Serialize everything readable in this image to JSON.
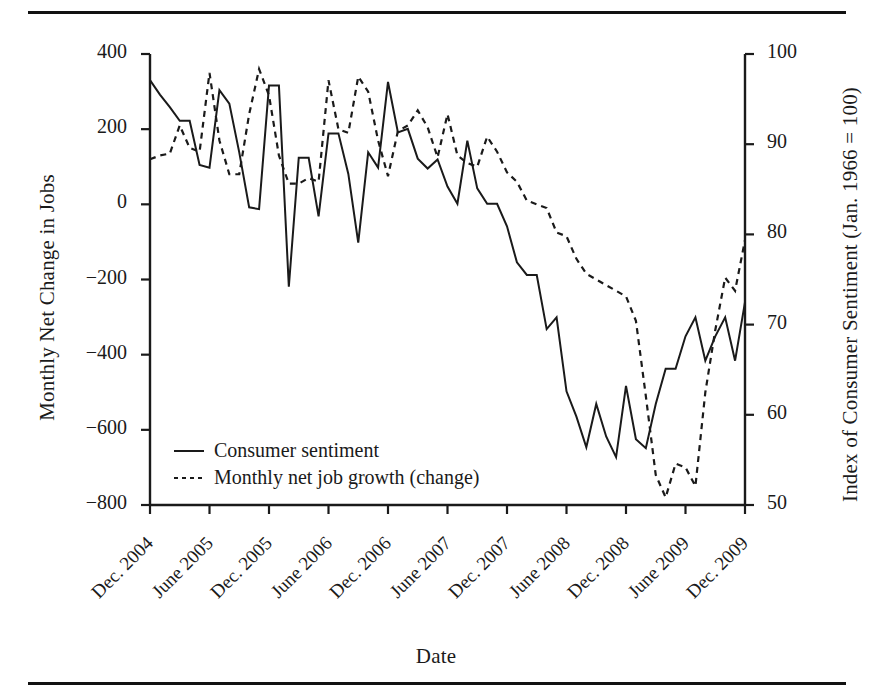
{
  "figure": {
    "has_top_rule": true,
    "has_bottom_rule": true,
    "background": "#ffffff",
    "ink_color": "#1a1a1a"
  },
  "chart_data": {
    "type": "line",
    "title": "",
    "xlabel": "Date",
    "ylabel": "Monthly Net Change in Jobs",
    "y2label": "Index of Consumer Sentiment (Jan. 1966 = 100)",
    "grid": false,
    "legend_position": "inside-bottom-left",
    "ylim": [
      -800,
      400
    ],
    "y2lim": [
      50,
      100
    ],
    "yticks": [
      "400",
      "200",
      "0",
      "−200",
      "−400",
      "−600",
      "−800"
    ],
    "ytick_values": [
      400,
      200,
      0,
      -200,
      -400,
      -600,
      -800
    ],
    "y2ticks": [
      "100",
      "90",
      "80",
      "70",
      "60",
      "50"
    ],
    "y2tick_values": [
      100,
      90,
      80,
      70,
      60,
      50
    ],
    "xtick_labels": [
      "Dec. 2004",
      "June 2005",
      "Dec. 2005",
      "June 2006",
      "Dec. 2006",
      "June 2007",
      "Dec. 2007",
      "June 2008",
      "Dec. 2008",
      "June 2009",
      "Dec. 2009"
    ],
    "x_index_of_ticks": [
      0,
      6,
      12,
      18,
      24,
      30,
      36,
      42,
      48,
      54,
      60
    ],
    "n_points": 61,
    "series": [
      {
        "name": "Monthly net job growth (change)",
        "axis": "left",
        "style": "dotted",
        "units": "thousands of jobs",
        "values": [
          120,
          130,
          135,
          210,
          150,
          140,
          350,
          170,
          80,
          80,
          240,
          360,
          290,
          130,
          55,
          55,
          70,
          60,
          330,
          200,
          190,
          340,
          300,
          170,
          75,
          195,
          210,
          250,
          205,
          125,
          240,
          130,
          110,
          100,
          180,
          140,
          85,
          60,
          10,
          0,
          -10,
          -75,
          -85,
          -145,
          -185,
          -200,
          -215,
          -230,
          -245,
          -310,
          -510,
          -720,
          -780,
          -690,
          -700,
          -750,
          -500,
          -335,
          -195,
          -230,
          -95
        ]
      },
      {
        "name": "Consumer sentiment",
        "axis": "right",
        "style": "solid",
        "units": "index",
        "values": [
          97.1,
          95.5,
          94.1,
          92.6,
          92.6,
          87.7,
          87.4,
          96.0,
          94.5,
          89.1,
          83.0,
          82.8,
          96.5,
          96.5,
          74.2,
          88.5,
          88.5,
          82.0,
          91.2,
          91.2,
          86.7,
          79.1,
          89.1,
          87.4,
          96.9,
          91.3,
          91.7,
          88.4,
          87.3,
          88.3,
          85.3,
          83.4,
          90.4,
          85.1,
          83.4,
          83.4,
          80.9,
          76.9,
          75.5,
          75.5,
          69.5,
          70.8,
          62.6,
          59.8,
          56.4,
          61.2,
          57.6,
          55.3,
          63.2,
          57.3,
          56.3,
          61.2,
          65.1,
          65.1,
          68.7,
          70.8,
          66.0,
          68.7,
          70.8,
          66.0,
          72.5
        ]
      }
    ]
  },
  "legend": {
    "items": [
      {
        "label": "Consumer sentiment",
        "style": "solid"
      },
      {
        "label": "Monthly net job growth (change)",
        "style": "dotted"
      }
    ]
  }
}
